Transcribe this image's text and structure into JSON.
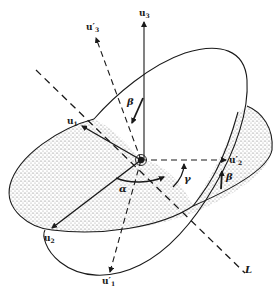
{
  "diagram": {
    "colors": {
      "line": "#1a1a1a",
      "stipple": "#b8b8b8",
      "background": "#ffffff"
    },
    "labels": {
      "u3": {
        "base": "u",
        "sub": "3",
        "prime": ""
      },
      "u3p": {
        "base": "u",
        "sub": "3",
        "prime": "′"
      },
      "u1": {
        "base": "u",
        "sub": "1",
        "prime": ""
      },
      "u2": {
        "base": "u",
        "sub": "2",
        "prime": ""
      },
      "u1p": {
        "base": "u",
        "sub": "1",
        "prime": "′"
      },
      "u2p": {
        "base": "u",
        "sub": "2",
        "prime": "′"
      },
      "L": "L"
    },
    "angles": {
      "alpha": "α",
      "beta_top": "β",
      "beta_right": "β",
      "gamma": "γ"
    }
  }
}
